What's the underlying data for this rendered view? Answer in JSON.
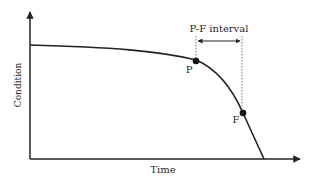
{
  "diagram": {
    "type": "P-F curve",
    "y_axis_label": "Condition",
    "x_axis_label": "Time",
    "points": [
      {
        "id": "P",
        "label": "P"
      },
      {
        "id": "F",
        "label": "F"
      }
    ],
    "interval_label": "P-F interval",
    "colors": {
      "line": "#222222",
      "background": "#ffffff"
    }
  }
}
